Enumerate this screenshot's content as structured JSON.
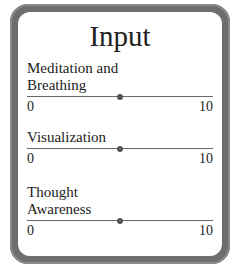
{
  "panel": {
    "title": "Input"
  },
  "sliders": [
    {
      "label_line1": "Meditation and",
      "label_line2": "Breathing",
      "min": "0",
      "max": "10",
      "value": 5
    },
    {
      "label_line1": "Visualization",
      "label_line2": "",
      "min": "0",
      "max": "10",
      "value": 5
    },
    {
      "label_line1": "Thought",
      "label_line2": "Awareness",
      "min": "0",
      "max": "10",
      "value": 5
    }
  ],
  "colors": {
    "frame": "#6e6e6e",
    "panel": "#ffffff",
    "track": "#6a6a6a",
    "knob": "#555555"
  }
}
